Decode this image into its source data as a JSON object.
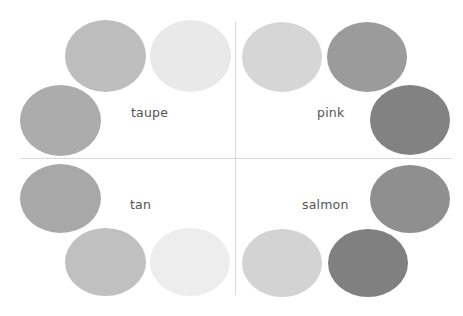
{
  "quadrants": [
    {
      "label": "taupe",
      "swatches": [
        {
          "color": "#bdbdbd"
        },
        {
          "color": "#e9e9e9"
        },
        {
          "color": "#acacac"
        }
      ]
    },
    {
      "label": "pink",
      "swatches": [
        {
          "color": "#d6d6d6"
        },
        {
          "color": "#9b9b9b"
        },
        {
          "color": "#828282"
        }
      ]
    },
    {
      "label": "tan",
      "swatches": [
        {
          "color": "#a8a8a8"
        },
        {
          "color": "#c0c0c0"
        },
        {
          "color": "#ededed"
        }
      ]
    },
    {
      "label": "salmon",
      "swatches": [
        {
          "color": "#8f8f8f"
        },
        {
          "color": "#d3d3d3"
        },
        {
          "color": "#808080"
        }
      ]
    }
  ],
  "divider_color": "#d9d9d9"
}
